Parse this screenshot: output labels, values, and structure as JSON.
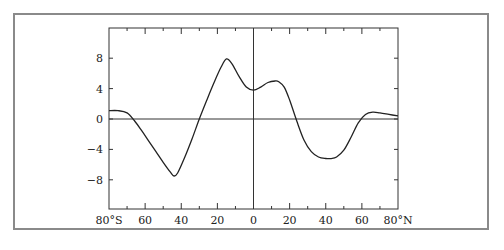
{
  "chart_data": {
    "type": "line",
    "title": "",
    "xlabel": "",
    "ylabel": "",
    "xlim": [
      -80,
      80
    ],
    "ylim": [
      -12,
      12
    ],
    "grid": false,
    "legend": null,
    "x_ticks": [
      -80,
      -60,
      -40,
      -20,
      0,
      20,
      40,
      60,
      80
    ],
    "x_tick_labels": [
      "80°S",
      "60",
      "40",
      "20",
      "0",
      "20",
      "40",
      "60",
      "80°N"
    ],
    "x_minor_ticks": [
      -70,
      -50,
      -30,
      -10,
      10,
      30,
      50,
      70
    ],
    "y_ticks": [
      8,
      4,
      0,
      -4,
      -8
    ],
    "y_tick_labels": [
      "8",
      "4",
      "0",
      "−4",
      "−8"
    ],
    "reference_lines": {
      "horizontal_at_y": 0,
      "vertical_at_x": 0
    },
    "series": [
      {
        "name": "profile",
        "color": "#222222",
        "x": [
          -80,
          -75,
          -70,
          -66,
          -62,
          -58,
          -54,
          -50,
          -46,
          -44,
          -42,
          -38,
          -34,
          -30,
          -26,
          -22,
          -18,
          -15,
          -12,
          -8,
          -4,
          0,
          4,
          8,
          12,
          14,
          17,
          20,
          24,
          28,
          32,
          36,
          40,
          43,
          46,
          50,
          54,
          58,
          62,
          66,
          70,
          75,
          80
        ],
        "y": [
          1.1,
          1.1,
          0.8,
          -0.2,
          -1.5,
          -2.9,
          -4.3,
          -5.7,
          -7.0,
          -7.5,
          -7.1,
          -5.0,
          -2.6,
          0.0,
          2.4,
          4.7,
          6.8,
          7.9,
          7.3,
          5.6,
          4.2,
          3.8,
          4.2,
          4.8,
          5.0,
          4.9,
          4.2,
          2.5,
          -0.3,
          -2.8,
          -4.3,
          -5.0,
          -5.2,
          -5.2,
          -5.0,
          -4.1,
          -2.4,
          -0.5,
          0.6,
          0.9,
          0.8,
          0.6,
          0.4
        ]
      }
    ]
  },
  "layout": {
    "plot_left_px": 109,
    "plot_right_px": 398,
    "plot_top_px": 28,
    "plot_bottom_px": 209,
    "axis_color": "#333333",
    "border_color": "#8a8a8a"
  }
}
